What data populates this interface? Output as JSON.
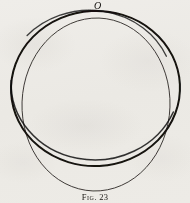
{
  "figure": {
    "background_color": "#f6f5f3",
    "ink_color": "#14120f",
    "point_labels": [
      {
        "text": "O",
        "x": 97,
        "y": 6
      }
    ],
    "caption": {
      "prefix": "Fig.",
      "number": "23",
      "full": "Fig. 23"
    },
    "shapes": [
      {
        "name": "outer-circle",
        "role": "heavy-stroke-circle",
        "type": "ellipse",
        "cx": 95.5,
        "cy": 88.5,
        "rx": 84.5,
        "ry": 77.5,
        "rotation_deg": -3,
        "stroke": "#141210",
        "stroke_width": 2.0
      },
      {
        "name": "inner-circle",
        "role": "light-stroke-circle",
        "type": "ellipse",
        "cx": 96.0,
        "cy": 104.5,
        "rx": 74.0,
        "ry": 86.5,
        "rotation_deg": 2,
        "stroke": "#2b2724",
        "stroke_width": 0.9
      }
    ]
  }
}
